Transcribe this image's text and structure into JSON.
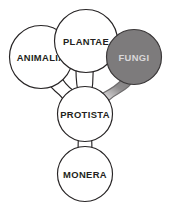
{
  "diagram": {
    "type": "tree-diagram",
    "background_color": "#ffffff",
    "nodes": [
      {
        "id": "animalia",
        "label": "ANIMALIA",
        "cx": 41,
        "cy": 57,
        "r": 31.5,
        "fill": "#ffffff",
        "stroke": "#272425",
        "text_color": "#231f20",
        "highlighted": false
      },
      {
        "id": "plantae",
        "label": "PLANTAE",
        "cx": 86,
        "cy": 41,
        "r": 31.5,
        "fill": "#ffffff",
        "stroke": "#272425",
        "text_color": "#231f20",
        "highlighted": false
      },
      {
        "id": "fungi",
        "label": "FUNGI",
        "cx": 134,
        "cy": 57,
        "r": 27.5,
        "fill": "#7d7b7c",
        "stroke": "#3a3738",
        "text_color": "#d9d7d8",
        "highlighted": true
      },
      {
        "id": "protista",
        "label": "PROTISTA",
        "cx": 85,
        "cy": 114,
        "r": 27.5,
        "fill": "#ffffff",
        "stroke": "#272425",
        "text_color": "#231f20",
        "highlighted": false
      },
      {
        "id": "monera",
        "label": "MONERA",
        "cx": 85,
        "cy": 174,
        "r": 27.5,
        "fill": "#ffffff",
        "stroke": "#272425",
        "text_color": "#231f20",
        "highlighted": false
      }
    ],
    "connectors": [
      {
        "id": "animalia-protista",
        "from": "animalia",
        "to": "protista",
        "shaded": false
      },
      {
        "id": "plantae-protista",
        "from": "plantae",
        "to": "protista",
        "shaded": false
      },
      {
        "id": "fungi-protista",
        "from": "fungi",
        "to": "protista",
        "shaded": true
      },
      {
        "id": "protista-monera",
        "from": "protista",
        "to": "monera",
        "shaded": false
      }
    ]
  }
}
